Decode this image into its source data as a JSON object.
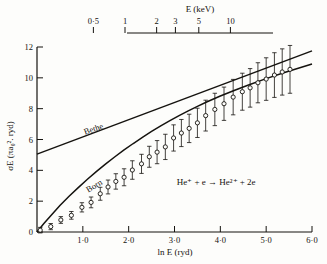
{
  "chart_data": {
    "type": "scatter",
    "title": "",
    "xlabel": "ln E (ryd)",
    "ylabel": "σE (πa₀². ryd)",
    "top_axis_label": "E (keV)",
    "xlim": [
      0,
      6.0
    ],
    "ylim": [
      0,
      12
    ],
    "grid": false,
    "legend": "none",
    "xticks": [
      "1·0",
      "2·0",
      "3·0",
      "4·0",
      "5·0",
      "6·0"
    ],
    "xtick_values": [
      1.0,
      2.0,
      3.0,
      4.0,
      5.0,
      6.0
    ],
    "yticks": [
      "0",
      "2",
      "4",
      "6",
      "8",
      "10",
      "12"
    ],
    "ytick_values": [
      0,
      2,
      4,
      6,
      8,
      10,
      12
    ],
    "top_ticks": [
      "0·5",
      "1",
      "2",
      "3",
      "5",
      "10"
    ],
    "top_tick_x": [
      1.23,
      1.92,
      2.61,
      3.02,
      3.53,
      4.22
    ],
    "annotations": [
      {
        "text": "Bethe",
        "x": 1.05,
        "y": 6.3,
        "rotation": -19
      },
      {
        "text": "Born",
        "x": 1.12,
        "y": 2.55,
        "rotation": -31
      },
      {
        "text": "He⁺ + e → He²⁺ + 2e",
        "x": 3.05,
        "y": 3.05,
        "rotation": 0
      }
    ],
    "series": [
      {
        "name": "Bethe",
        "type": "line",
        "x": [
          0.0,
          6.0
        ],
        "y": [
          5.05,
          11.75
        ]
      },
      {
        "name": "Born",
        "type": "line",
        "x": [
          0.0,
          0.15,
          0.3,
          0.5,
          0.7,
          0.9,
          1.1,
          1.3,
          1.5,
          1.7,
          1.9,
          2.1,
          2.3,
          2.5,
          2.7,
          2.9,
          3.1,
          3.3,
          3.5,
          3.7,
          4.0,
          4.3,
          4.6,
          5.0,
          5.4,
          6.0
        ],
        "y": [
          0.0,
          0.55,
          1.05,
          1.72,
          2.32,
          2.88,
          3.42,
          3.93,
          4.42,
          4.88,
          5.32,
          5.74,
          6.14,
          6.52,
          6.88,
          7.22,
          7.55,
          7.86,
          8.15,
          8.43,
          8.82,
          9.18,
          9.52,
          9.95,
          10.35,
          10.9
        ]
      },
      {
        "name": "measurements",
        "type": "scatter_errorbar",
        "marker": "open-circle",
        "points": [
          {
            "x": 0.07,
            "y": 0.12,
            "err": 0.18
          },
          {
            "x": 0.3,
            "y": 0.35,
            "err": 0.2
          },
          {
            "x": 0.52,
            "y": 0.78,
            "err": 0.22
          },
          {
            "x": 0.75,
            "y": 1.08,
            "err": 0.25
          },
          {
            "x": 0.98,
            "y": 1.6,
            "err": 0.3
          },
          {
            "x": 1.18,
            "y": 1.92,
            "err": 0.35
          },
          {
            "x": 1.38,
            "y": 2.48,
            "err": 0.42
          },
          {
            "x": 1.55,
            "y": 2.92,
            "err": 0.45
          },
          {
            "x": 1.72,
            "y": 3.28,
            "err": 0.5
          },
          {
            "x": 1.9,
            "y": 3.55,
            "err": 0.55
          },
          {
            "x": 2.08,
            "y": 4.02,
            "err": 0.6
          },
          {
            "x": 2.28,
            "y": 4.42,
            "err": 0.62
          },
          {
            "x": 2.45,
            "y": 4.88,
            "err": 0.68
          },
          {
            "x": 2.62,
            "y": 5.18,
            "err": 0.75
          },
          {
            "x": 2.8,
            "y": 5.52,
            "err": 0.82
          },
          {
            "x": 2.98,
            "y": 6.1,
            "err": 0.85
          },
          {
            "x": 3.15,
            "y": 6.42,
            "err": 0.88
          },
          {
            "x": 3.32,
            "y": 6.72,
            "err": 0.92
          },
          {
            "x": 3.5,
            "y": 7.08,
            "err": 0.95
          },
          {
            "x": 3.68,
            "y": 7.55,
            "err": 1.0
          },
          {
            "x": 3.88,
            "y": 7.95,
            "err": 1.05
          },
          {
            "x": 4.08,
            "y": 8.32,
            "err": 1.08
          },
          {
            "x": 4.28,
            "y": 8.75,
            "err": 1.15
          },
          {
            "x": 4.48,
            "y": 9.1,
            "err": 1.2
          },
          {
            "x": 4.65,
            "y": 9.35,
            "err": 1.25
          },
          {
            "x": 4.82,
            "y": 9.68,
            "err": 1.3
          },
          {
            "x": 5.0,
            "y": 9.92,
            "err": 1.38
          },
          {
            "x": 5.18,
            "y": 10.18,
            "err": 1.45
          },
          {
            "x": 5.35,
            "y": 10.38,
            "err": 1.5
          },
          {
            "x": 5.52,
            "y": 10.55,
            "err": 1.55
          }
        ]
      }
    ]
  },
  "colors": {
    "ink": "#15130f",
    "paper": "#fdfdfb"
  }
}
